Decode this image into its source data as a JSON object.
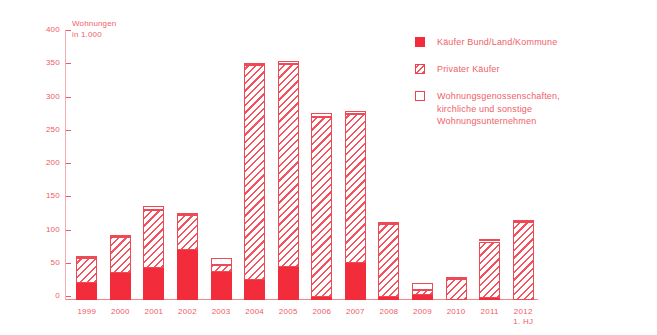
{
  "chart_data": {
    "type": "bar",
    "title": "",
    "subtitle": "",
    "xlabel": "",
    "ylabel": "Wohnungen\nin 1.000",
    "ylim": [
      0,
      400
    ],
    "ytick_step": 50,
    "yticks": [
      "400",
      "350",
      "300",
      "250",
      "200",
      "150",
      "100",
      "50",
      "0"
    ],
    "grid": false,
    "stacked": true,
    "legend_position": "top-right",
    "categories": [
      "1999",
      "2000",
      "2001",
      "2002",
      "2003",
      "2004",
      "2005",
      "2006",
      "2007",
      "2008",
      "2009",
      "2010",
      "2011",
      "2012\n1. HJ"
    ],
    "series": [
      {
        "name": "Käufer Bund/Land/Kommune",
        "style": "solid",
        "values": [
          25,
          40,
          48,
          75,
          42,
          30,
          50,
          5,
          55,
          5,
          8,
          0,
          3,
          0
        ]
      },
      {
        "name": "Privater Käufer",
        "style": "hatched",
        "values": [
          38,
          55,
          88,
          53,
          10,
          323,
          305,
          270,
          225,
          110,
          7,
          31,
          85,
          118
        ]
      },
      {
        "name": "Wohnungsgenossenschaften, kirchliche und sonstige Wohnungsunternehmen",
        "style": "outline",
        "values": [
          1,
          2,
          5,
          3,
          11,
          3,
          5,
          6,
          5,
          3,
          10,
          1,
          1,
          1
        ]
      }
    ],
    "totals": [
      64,
      97,
      141,
      131,
      63,
      356,
      360,
      281,
      285,
      118,
      25,
      32,
      89,
      119
    ]
  },
  "legend": {
    "items": [
      {
        "label": "Käufer Bund/Land/Kommune",
        "swatch": "solid-square-icon",
        "color": "#f32c3b"
      },
      {
        "label": "Privater Käufer",
        "swatch": "hatched-square-icon",
        "color": "#f4525e"
      },
      {
        "label": "Wohnungsgenossenschaften,\nkirchliche und sonstige\nWohnungsunternehmen",
        "swatch": "open-square-icon",
        "color": "#ffffff"
      }
    ]
  },
  "colors": {
    "accent": "#f32c3b",
    "text": "#ef5a64",
    "hatch": "#f4525e",
    "axis": "#f5aab0",
    "background": "#ffffff"
  }
}
